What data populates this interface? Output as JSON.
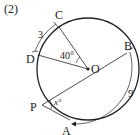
{
  "problem": {
    "number_label": "(2)"
  },
  "points": {
    "C": "C",
    "D": "D",
    "O": "O",
    "B": "B",
    "P": "P",
    "A": "A"
  },
  "measures": {
    "arc_CD": "3",
    "angle_COD": "40°",
    "angle_P": "x°",
    "arc_BA": "9"
  },
  "colors": {
    "stroke": "#222222",
    "background": "#ffffff"
  }
}
